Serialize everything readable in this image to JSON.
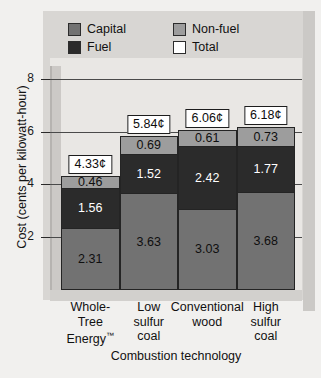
{
  "chart_data": {
    "type": "bar",
    "stacked": true,
    "title": "",
    "xlabel": "Combustion technology",
    "ylabel": "Cost (cents per kilowatt-hour)",
    "ylim": [
      0,
      9
    ],
    "yticks": [
      2,
      4,
      6,
      8
    ],
    "ytick_labels": [
      "2",
      "4",
      "6",
      "8"
    ],
    "grid": true,
    "legend_position": "top-inside",
    "categories": [
      "Whole-Tree Energy™",
      "Low sulfur coal",
      "Conventional wood",
      "High sulfur coal"
    ],
    "category_lines": [
      [
        "Whole-",
        "Tree",
        "Energy™"
      ],
      [
        "Low",
        "sulfur",
        "coal"
      ],
      [
        "Conventional",
        "wood"
      ],
      [
        "High",
        "sulfur",
        "coal"
      ]
    ],
    "series": [
      {
        "name": "Capital",
        "color": "#727272",
        "values": [
          2.31,
          3.63,
          3.03,
          3.68
        ]
      },
      {
        "name": "Fuel",
        "color": "#2b2b2b",
        "values": [
          1.56,
          1.52,
          2.42,
          1.77
        ]
      },
      {
        "name": "Non-fuel",
        "color": "#9d9d9d",
        "values": [
          0.46,
          0.69,
          0.61,
          0.73
        ]
      }
    ],
    "totals": [
      4.33,
      5.84,
      6.06,
      6.18
    ],
    "total_labels": [
      "4.33¢",
      "5.84¢",
      "6.06¢",
      "6.18¢"
    ],
    "value_labels": {
      "capital": [
        "2.31",
        "3.63",
        "3.03",
        "3.68"
      ],
      "fuel": [
        "1.56",
        "1.52",
        "2.42",
        "1.77"
      ],
      "nonfuel": [
        "0.46",
        "0.69",
        "0.61",
        "0.73"
      ]
    },
    "legend": [
      {
        "label": "Capital",
        "color": "#727272"
      },
      {
        "label": "Non-fuel",
        "color": "#9d9d9d"
      },
      {
        "label": "Fuel",
        "color": "#2b2b2b"
      },
      {
        "label": "Total",
        "color": "#ffffff"
      }
    ]
  }
}
